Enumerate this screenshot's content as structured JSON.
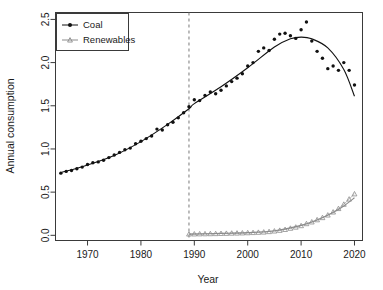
{
  "chart_data": {
    "type": "scatter",
    "title": "",
    "xlabel": "Year",
    "ylabel": "Annual consumption",
    "xlim": [
      1964,
      2021.5
    ],
    "ylim": [
      -0.06,
      2.58
    ],
    "xticks": [
      1970,
      1980,
      1990,
      2000,
      2010,
      2020
    ],
    "xtick_labels": [
      "1970",
      "1980",
      "1990",
      "2000",
      "2010",
      "2020"
    ],
    "yticks": [
      0.0,
      0.5,
      1.0,
      1.5,
      2.0,
      2.5
    ],
    "ytick_labels": [
      "0.0",
      "0.5",
      "1.0",
      "1.5",
      "2.0",
      "2.5"
    ],
    "grid": false,
    "legend_position": "top-left",
    "annotations": [
      {
        "name": "intervention-line",
        "type": "vline",
        "x": 1989,
        "style": "dashed",
        "color": "#7a7a7a"
      }
    ],
    "series": [
      {
        "name": "Coal",
        "marker": "point",
        "color": "#111111",
        "fit_color": "#111111",
        "x": [
          1965,
          1966,
          1967,
          1968,
          1969,
          1970,
          1971,
          1972,
          1973,
          1974,
          1975,
          1976,
          1977,
          1978,
          1979,
          1980,
          1981,
          1982,
          1983,
          1984,
          1985,
          1986,
          1987,
          1988,
          1989,
          1990,
          1991,
          1992,
          1993,
          1994,
          1995,
          1996,
          1997,
          1998,
          1999,
          2000,
          2001,
          2002,
          2003,
          2004,
          2005,
          2006,
          2007,
          2008,
          2009,
          2010,
          2011,
          2012,
          2013,
          2014,
          2015,
          2016,
          2017,
          2018,
          2019,
          2020
        ],
        "y": [
          0.72,
          0.74,
          0.75,
          0.77,
          0.79,
          0.82,
          0.84,
          0.85,
          0.87,
          0.9,
          0.93,
          0.96,
          0.99,
          1.01,
          1.06,
          1.09,
          1.12,
          1.15,
          1.23,
          1.22,
          1.28,
          1.31,
          1.36,
          1.42,
          1.49,
          1.57,
          1.56,
          1.62,
          1.66,
          1.64,
          1.68,
          1.73,
          1.78,
          1.82,
          1.87,
          1.96,
          2.0,
          2.13,
          2.17,
          2.14,
          2.27,
          2.33,
          2.34,
          2.31,
          2.28,
          2.38,
          2.47,
          2.25,
          2.13,
          2.05,
          1.93,
          1.96,
          1.91,
          2.0,
          1.91,
          1.74
        ],
        "fit_x": [
          1965,
          1970,
          1975,
          1980,
          1985,
          1989,
          1990,
          1995,
          2000,
          2005,
          2008,
          2010,
          2012,
          2015,
          2018,
          2020
        ],
        "fit_y": [
          0.725,
          0.815,
          0.925,
          1.085,
          1.285,
          1.465,
          1.525,
          1.72,
          1.94,
          2.18,
          2.275,
          2.295,
          2.275,
          2.17,
          1.92,
          1.61
        ]
      },
      {
        "name": "Renewables",
        "marker": "triangle",
        "color": "#8c8c8c",
        "fit_color": "#8c8c8c",
        "x": [
          1989,
          1990,
          1991,
          1992,
          1993,
          1994,
          1995,
          1996,
          1997,
          1998,
          1999,
          2000,
          2001,
          2002,
          2003,
          2004,
          2005,
          2006,
          2007,
          2008,
          2009,
          2010,
          2011,
          2012,
          2013,
          2014,
          2015,
          2016,
          2017,
          2018,
          2019,
          2020
        ],
        "y": [
          0.015,
          0.016,
          0.017,
          0.018,
          0.019,
          0.02,
          0.022,
          0.023,
          0.025,
          0.026,
          0.028,
          0.03,
          0.032,
          0.035,
          0.038,
          0.043,
          0.05,
          0.058,
          0.068,
          0.082,
          0.095,
          0.112,
          0.135,
          0.155,
          0.18,
          0.205,
          0.235,
          0.27,
          0.31,
          0.36,
          0.42,
          0.48
        ],
        "fit_x": [
          1989,
          1995,
          2000,
          2005,
          2010,
          2013,
          2016,
          2018,
          2020
        ],
        "fit_y": [
          0.014,
          0.022,
          0.031,
          0.052,
          0.115,
          0.178,
          0.265,
          0.34,
          0.435
        ]
      }
    ]
  },
  "legend": {
    "entries": [
      {
        "label": "Coal",
        "marker": "point",
        "color": "#111111"
      },
      {
        "label": "Renewables",
        "marker": "triangle",
        "color": "#8c8c8c"
      }
    ]
  },
  "axes": {
    "x_title": "Year",
    "y_title": "Annual consumption"
  },
  "colors": {
    "coal": "#111111",
    "renewables": "#8c8c8c",
    "axis": "#3a3a3a",
    "vline": "#7a7a7a",
    "background": "#ffffff"
  }
}
